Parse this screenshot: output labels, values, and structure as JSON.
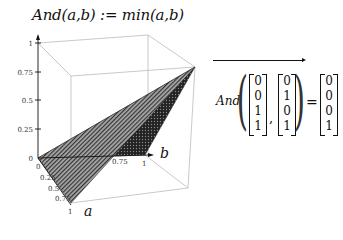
{
  "definition": {
    "text": "And(a,b) := min(a,b)"
  },
  "plot": {
    "z_ticks": [
      "1",
      "0.75",
      "0.5",
      "0.25",
      "0"
    ],
    "a_ticks": [
      "0",
      "0.25",
      "0.5",
      "0.75",
      "1"
    ],
    "b_ticks": [
      "0.75",
      "1"
    ],
    "a_label": "a",
    "b_label": "b"
  },
  "evaluation": {
    "function": "And",
    "arg1": [
      "0",
      "0",
      "1",
      "1"
    ],
    "arg2": [
      "0",
      "1",
      "0",
      "1"
    ],
    "result": [
      "0",
      "0",
      "0",
      "1"
    ]
  }
}
